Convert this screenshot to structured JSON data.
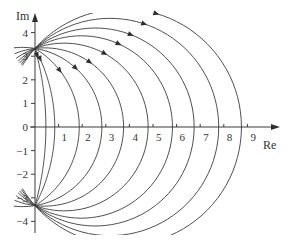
{
  "diagram": {
    "type": "complex-plane-circle-family",
    "axes": {
      "x_label": "Re",
      "y_label": "Im",
      "x_ticks": [
        "1",
        "2",
        "3",
        "4",
        "5",
        "6",
        "7",
        "8",
        "9"
      ],
      "y_ticks": [
        "4",
        "3",
        "2",
        "1",
        "0",
        "−1",
        "−2",
        "−3",
        "−4"
      ],
      "x_range": [
        0,
        10
      ],
      "y_range": [
        -4.5,
        4.6
      ]
    },
    "convergence_points": [
      {
        "re": 0,
        "im": 3.33
      },
      {
        "re": 0,
        "im": -3.33
      }
    ],
    "curves": [
      {
        "center_re": -11.8,
        "crosses_re_at": 0.46,
        "arrow": true
      },
      {
        "center_re": -6.2,
        "crosses_re_at": 0.83,
        "arrow": true
      },
      {
        "center_re": -2.02,
        "crosses_re_at": 1.88,
        "arrow": true
      },
      {
        "center_re": -0.54,
        "crosses_re_at": 2.83,
        "arrow": true
      },
      {
        "center_re": 0.4,
        "crosses_re_at": 3.75,
        "arrow": true
      },
      {
        "center_re": 1.24,
        "crosses_re_at": 4.79,
        "arrow": true
      },
      {
        "center_re": 1.96,
        "crosses_re_at": 5.83,
        "arrow": true
      },
      {
        "center_re": 2.55,
        "crosses_re_at": 6.75,
        "arrow": true
      },
      {
        "center_re": 3.18,
        "crosses_re_at": 7.79,
        "arrow": true
      },
      {
        "center_re": 3.74,
        "crosses_re_at": 8.75,
        "arrow": true
      }
    ],
    "colors": {
      "ink": "#3c3c3c",
      "background": "#ffffff"
    }
  }
}
